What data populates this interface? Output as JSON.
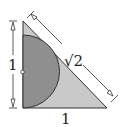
{
  "diagram": {
    "labels": {
      "vertical_leg": "1",
      "horizontal_leg": "1",
      "hypotenuse": "√2"
    },
    "colors": {
      "triangle_fill": "#c9c9c9",
      "semicircle_fill": "#8f8f8f",
      "stroke": "#333333",
      "background": "#ffffff"
    }
  }
}
